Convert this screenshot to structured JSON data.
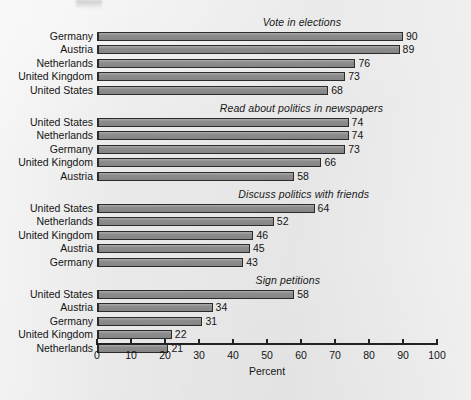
{
  "chart_data": {
    "type": "bar",
    "orientation": "horizontal",
    "title": "",
    "xlabel": "Percent",
    "ylabel": "",
    "xlim": [
      0,
      100
    ],
    "xticks": [
      0,
      10,
      20,
      30,
      40,
      50,
      60,
      70,
      80,
      90,
      100
    ],
    "grid": false,
    "legend": false,
    "value_labels": true,
    "panels": [
      {
        "title": "Vote in elections",
        "categories": [
          "Germany",
          "Austria",
          "Netherlands",
          "United Kingdom",
          "United States"
        ],
        "values": [
          90,
          89,
          76,
          73,
          68
        ]
      },
      {
        "title": "Read about politics in newspapers",
        "categories": [
          "United States",
          "Netherlands",
          "Germany",
          "United Kingdom",
          "Austria"
        ],
        "values": [
          74,
          74,
          73,
          66,
          58
        ]
      },
      {
        "title": "Discuss politics with friends",
        "categories": [
          "United States",
          "Netherlands",
          "United Kingdom",
          "Austria",
          "Germany"
        ],
        "values": [
          64,
          52,
          46,
          45,
          43
        ]
      },
      {
        "title": "Sign petitions",
        "categories": [
          "United States",
          "Austria",
          "Germany",
          "United Kingdom",
          "Netherlands"
        ],
        "values": [
          58,
          34,
          31,
          22,
          21
        ]
      }
    ],
    "colors": {
      "background": "#e9e9e9",
      "bar_fill": "#8d8d8d",
      "bar_stroke": "#2b2b2b",
      "text": "#141414",
      "axis": "#222222"
    }
  }
}
